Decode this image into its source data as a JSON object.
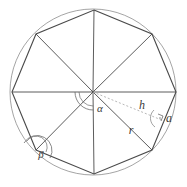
{
  "figure": {
    "shape": "regular-octagon",
    "sides": 8,
    "background_color": "#ffffff",
    "circle": {
      "label": "circumscribed circle",
      "center_x": 93,
      "center_y": 92,
      "radius": 83,
      "stroke_color": "#9a9a9a",
      "stroke_width": 0.9
    },
    "polygon": {
      "label": "regular octagon",
      "stroke_color": "#4a4a4a",
      "stroke_width": 1.1,
      "fill": "none",
      "vertices": [
        {
          "name": "top",
          "x": 94,
          "y": 10
        },
        {
          "name": "upper-right",
          "x": 152,
          "y": 34
        },
        {
          "name": "right",
          "x": 176,
          "y": 92
        },
        {
          "name": "lower-right",
          "x": 152,
          "y": 150
        },
        {
          "name": "bottom",
          "x": 94,
          "y": 174
        },
        {
          "name": "lower-left",
          "x": 36,
          "y": 150
        },
        {
          "name": "left",
          "x": 12,
          "y": 92
        },
        {
          "name": "upper-left",
          "x": 36,
          "y": 34
        }
      ]
    },
    "radii": {
      "label": "radii from center to each vertex",
      "stroke_color": "#4a4a4a",
      "stroke_width": 0.9
    },
    "apothem": {
      "label": "apothem h (dashed)",
      "stroke_color": "#b0b0b0",
      "stroke_width": 0.9,
      "dash_pattern": "2,2",
      "from_x": 93,
      "from_y": 92,
      "to_x": 164,
      "to_y": 121
    },
    "markers": {
      "right_angle": {
        "name": "right-angle-marker",
        "x": 158,
        "y": 116,
        "size": 7,
        "stroke_color": "#6a6a6a"
      },
      "center_angle_arc": {
        "name": "alpha-arc",
        "radius": 18,
        "stroke_color": "#6a6a6a"
      },
      "vertex_angle_arc": {
        "name": "beta-arc",
        "radius": 15,
        "stroke_color": "#6a6a6a"
      },
      "apothem_angle_arc": {
        "name": "h-r-arc",
        "radius": 10,
        "stroke_color": "#8a8a8a"
      }
    },
    "labels": [
      {
        "id": "alpha",
        "text": "α",
        "x": 100,
        "y": 112,
        "size": 11,
        "description": "central angle at circle center"
      },
      {
        "id": "beta",
        "text": "β",
        "x": 41,
        "y": 158,
        "size": 11,
        "description": "interior angle at lower-left vertex"
      },
      {
        "id": "h",
        "text": "h",
        "x": 142,
        "y": 109,
        "size": 12,
        "description": "apothem length"
      },
      {
        "id": "r",
        "text": "r",
        "x": 131,
        "y": 134,
        "size": 12,
        "description": "circumradius length"
      },
      {
        "id": "a",
        "text": "a",
        "x": 169,
        "y": 122,
        "size": 12,
        "description": "side length"
      }
    ]
  }
}
